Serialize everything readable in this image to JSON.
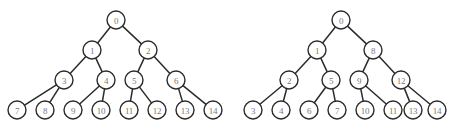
{
  "figure": {
    "background_color": "#ffffff",
    "stroke_color": "#2b2b2b",
    "node_fill_color": "#ffffff",
    "label_color": "#7a7a7a",
    "node_radius": 9
  },
  "chart_data": {
    "type": "diagram",
    "subtype": "binary-tree-pair",
    "title": "",
    "trees": [
      {
        "name": "left-tree",
        "numbering_scheme": "level-order (breadth-first)",
        "node_count": 15,
        "depth": 4,
        "nodes": [
          {
            "id": "L0",
            "label": "0",
            "x": 116,
            "y": 20,
            "level": 1
          },
          {
            "id": "L1",
            "label": "1",
            "x": 92,
            "y": 50,
            "level": 2
          },
          {
            "id": "L2",
            "label": "2",
            "x": 148,
            "y": 50,
            "level": 2
          },
          {
            "id": "L3",
            "label": "3",
            "x": 64,
            "y": 80,
            "level": 3
          },
          {
            "id": "L4",
            "label": "4",
            "x": 106,
            "y": 80,
            "level": 3
          },
          {
            "id": "L5",
            "label": "5",
            "x": 134,
            "y": 80,
            "level": 3
          },
          {
            "id": "L6",
            "label": "6",
            "x": 176,
            "y": 80,
            "level": 3
          },
          {
            "id": "L7",
            "label": "7",
            "x": 17,
            "y": 110,
            "level": 4
          },
          {
            "id": "L8",
            "label": "8",
            "x": 45,
            "y": 110,
            "level": 4
          },
          {
            "id": "L9",
            "label": "9",
            "x": 73,
            "y": 110,
            "level": 4
          },
          {
            "id": "L10",
            "label": "10",
            "x": 101,
            "y": 110,
            "level": 4
          },
          {
            "id": "L11",
            "label": "11",
            "x": 129,
            "y": 110,
            "level": 4
          },
          {
            "id": "L12",
            "label": "12",
            "x": 157,
            "y": 110,
            "level": 4
          },
          {
            "id": "L13",
            "label": "13",
            "x": 185,
            "y": 110,
            "level": 4
          },
          {
            "id": "L14",
            "label": "14",
            "x": 213,
            "y": 110,
            "level": 4
          }
        ],
        "edges": [
          {
            "from": "L0",
            "to": "L1"
          },
          {
            "from": "L0",
            "to": "L2"
          },
          {
            "from": "L1",
            "to": "L3"
          },
          {
            "from": "L1",
            "to": "L4"
          },
          {
            "from": "L2",
            "to": "L5"
          },
          {
            "from": "L2",
            "to": "L6"
          },
          {
            "from": "L3",
            "to": "L7"
          },
          {
            "from": "L3",
            "to": "L8"
          },
          {
            "from": "L4",
            "to": "L9"
          },
          {
            "from": "L4",
            "to": "L10"
          },
          {
            "from": "L5",
            "to": "L11"
          },
          {
            "from": "L5",
            "to": "L12"
          },
          {
            "from": "L6",
            "to": "L13"
          },
          {
            "from": "L6",
            "to": "L14"
          }
        ]
      },
      {
        "name": "right-tree",
        "numbering_scheme": "pre-order (depth-first)",
        "node_count": 15,
        "depth": 4,
        "nodes": [
          {
            "id": "R0",
            "label": "0",
            "x": 341,
            "y": 20,
            "level": 1
          },
          {
            "id": "R1",
            "label": "1",
            "x": 317,
            "y": 50,
            "level": 2
          },
          {
            "id": "R2",
            "label": "8",
            "x": 373,
            "y": 50,
            "level": 2
          },
          {
            "id": "R3",
            "label": "2",
            "x": 289,
            "y": 80,
            "level": 3
          },
          {
            "id": "R4",
            "label": "5",
            "x": 331,
            "y": 80,
            "level": 3
          },
          {
            "id": "R5",
            "label": "9",
            "x": 359,
            "y": 80,
            "level": 3
          },
          {
            "id": "R6",
            "label": "12",
            "x": 401,
            "y": 80,
            "level": 3
          },
          {
            "id": "R7",
            "label": "3",
            "x": 253,
            "y": 110,
            "level": 4
          },
          {
            "id": "R8",
            "label": "4",
            "x": 281,
            "y": 110,
            "level": 4
          },
          {
            "id": "R9",
            "label": "6",
            "x": 309,
            "y": 110,
            "level": 4
          },
          {
            "id": "R10",
            "label": "7",
            "x": 337,
            "y": 110,
            "level": 4
          },
          {
            "id": "R11",
            "label": "10",
            "x": 365,
            "y": 110,
            "level": 4
          },
          {
            "id": "R12",
            "label": "11",
            "x": 393,
            "y": 110,
            "level": 4
          },
          {
            "id": "R13",
            "label": "13",
            "x": 413,
            "y": 110,
            "level": 4
          },
          {
            "id": "R14",
            "label": "14",
            "x": 437,
            "y": 110,
            "level": 4
          }
        ],
        "edges": [
          {
            "from": "R0",
            "to": "R1"
          },
          {
            "from": "R0",
            "to": "R2"
          },
          {
            "from": "R1",
            "to": "R3"
          },
          {
            "from": "R1",
            "to": "R4"
          },
          {
            "from": "R2",
            "to": "R5"
          },
          {
            "from": "R2",
            "to": "R6"
          },
          {
            "from": "R3",
            "to": "R7"
          },
          {
            "from": "R3",
            "to": "R8"
          },
          {
            "from": "R4",
            "to": "R9"
          },
          {
            "from": "R4",
            "to": "R10"
          },
          {
            "from": "R5",
            "to": "R11"
          },
          {
            "from": "R5",
            "to": "R12"
          },
          {
            "from": "R6",
            "to": "R13"
          },
          {
            "from": "R6",
            "to": "R14"
          }
        ]
      }
    ]
  }
}
